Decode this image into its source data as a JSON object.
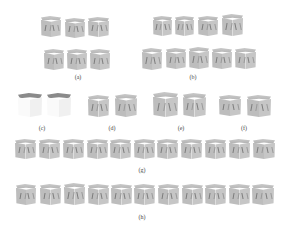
{
  "figure": {
    "panels": [
      {
        "id": "a",
        "label": "(a)",
        "label_pos": [
          78,
          77
        ],
        "cubes": [
          [
            41,
            16,
            20,
            21
          ],
          [
            65,
            18,
            20,
            20
          ],
          [
            88,
            17,
            21,
            20
          ],
          [
            44,
            49,
            20,
            21
          ],
          [
            67,
            49,
            20,
            21
          ],
          [
            90,
            49,
            20,
            21
          ]
        ]
      },
      {
        "id": "b",
        "label": "(b)",
        "label_pos": [
          193,
          77
        ],
        "cubes": [
          [
            153,
            16,
            19,
            20
          ],
          [
            175,
            16,
            19,
            20
          ],
          [
            198,
            16,
            20,
            20
          ],
          [
            222,
            14,
            21,
            22
          ],
          [
            142,
            48,
            20,
            22
          ],
          [
            166,
            48,
            20,
            21
          ],
          [
            189,
            47,
            20,
            22
          ],
          [
            212,
            48,
            20,
            21
          ],
          [
            235,
            48,
            21,
            21
          ]
        ]
      },
      {
        "id": "c",
        "label": "(c)",
        "label_pos": [
          42,
          128
        ],
        "style": "white",
        "cubes": [
          [
            18,
            93,
            24,
            24
          ],
          [
            47,
            93,
            24,
            24
          ]
        ]
      },
      {
        "id": "d",
        "label": "(d)",
        "label_pos": [
          112,
          128
        ],
        "cubes": [
          [
            88,
            95,
            21,
            22
          ],
          [
            115,
            94,
            22,
            23
          ]
        ]
      },
      {
        "id": "e",
        "label": "(e)",
        "label_pos": [
          181,
          128
        ],
        "cubes": [
          [
            153,
            92,
            25,
            25
          ],
          [
            183,
            93,
            23,
            24
          ]
        ]
      },
      {
        "id": "f",
        "label": "(f)",
        "label_pos": [
          244,
          128
        ],
        "cubes": [
          [
            219,
            95,
            22,
            21
          ],
          [
            247,
            95,
            24,
            22
          ]
        ]
      },
      {
        "id": "g",
        "label": "(g)",
        "label_pos": [
          142,
          170
        ],
        "cubes": [
          [
            15,
            139,
            21,
            20
          ],
          [
            39,
            139,
            21,
            20
          ],
          [
            63,
            139,
            21,
            20
          ],
          [
            87,
            139,
            21,
            20
          ],
          [
            110,
            139,
            21,
            20
          ],
          [
            134,
            139,
            21,
            20
          ],
          [
            157,
            139,
            21,
            20
          ],
          [
            181,
            139,
            21,
            20
          ],
          [
            205,
            139,
            21,
            20
          ],
          [
            229,
            139,
            21,
            20
          ],
          [
            253,
            139,
            22,
            20
          ]
        ]
      },
      {
        "id": "h",
        "label": "(h)",
        "label_pos": [
          142,
          217
        ],
        "cubes": [
          [
            16,
            184,
            20,
            21
          ],
          [
            40,
            184,
            21,
            21
          ],
          [
            64,
            183,
            21,
            22
          ],
          [
            88,
            184,
            21,
            21
          ],
          [
            111,
            184,
            21,
            21
          ],
          [
            134,
            184,
            21,
            21
          ],
          [
            158,
            184,
            21,
            21
          ],
          [
            182,
            184,
            21,
            21
          ],
          [
            205,
            184,
            21,
            21
          ],
          [
            229,
            184,
            21,
            21
          ],
          [
            252,
            184,
            22,
            21
          ]
        ]
      }
    ]
  },
  "labels": {
    "a": "(a)",
    "b": "(b)",
    "c": "(c)",
    "d": "(d)",
    "e": "(e)",
    "f": "(f)",
    "g": "(g)",
    "h": "(h)"
  }
}
